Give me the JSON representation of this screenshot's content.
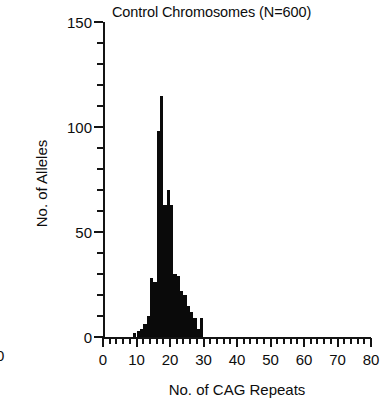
{
  "figure": {
    "title": "Control Chromosomes (N=600)",
    "neighbor_label": "0"
  },
  "axes": {
    "y": {
      "label": "No. of Alleles",
      "major_ticks": [
        0,
        50,
        100,
        150
      ],
      "minor_step": 10,
      "range": [
        0,
        150
      ]
    },
    "x": {
      "label": "No. of CAG Repeats",
      "major_ticks": [
        0,
        10,
        20,
        30,
        40,
        50,
        60,
        70,
        80
      ],
      "minor_step": 2,
      "range": [
        0,
        80
      ]
    }
  },
  "chart_data": {
    "type": "bar",
    "title": "Control Chromosomes (N=600)",
    "xlabel": "No. of CAG Repeats",
    "ylabel": "No. of Alleles",
    "xlim": [
      0,
      80
    ],
    "ylim": [
      0,
      150
    ],
    "grid": false,
    "legend": null,
    "bar_width_units": 1,
    "color": "#0a0a0a",
    "sample_size": 600,
    "categories": [
      9,
      10,
      11,
      12,
      13,
      14,
      15,
      16,
      17,
      18,
      19,
      20,
      21,
      22,
      23,
      24,
      25,
      26,
      27,
      28,
      29
    ],
    "values": [
      2,
      3,
      4,
      6,
      10,
      28,
      26,
      98,
      115,
      63,
      70,
      63,
      30,
      29,
      22,
      20,
      15,
      12,
      9,
      4,
      9
    ],
    "annotations": [
      "Sharply unimodal distribution peaking at 17 CAG repeats (~115 alleles).",
      "Range of observed alleles spans approximately 9 to 29 CAG repeats.",
      "Isolated bar near 29 repeats separated from the main mode."
    ]
  }
}
